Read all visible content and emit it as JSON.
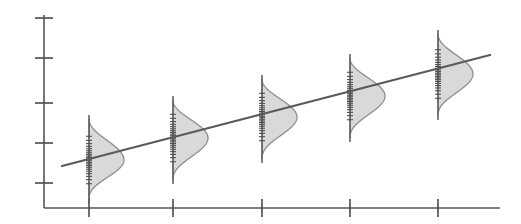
{
  "chart_data": {
    "type": "line",
    "title": "",
    "subtitle": "",
    "xlabel": "",
    "ylabel": "",
    "grid": false,
    "legend": null,
    "annotations": [],
    "axis": {
      "x_axis_visible": true,
      "y_axis_visible": true,
      "x_tick_labels": [
        "",
        "",
        "",
        "",
        ""
      ],
      "y_tick_labels": [
        "",
        "",
        "",
        "",
        ""
      ],
      "x_tick_count": 5,
      "y_tick_count": 5,
      "xlim": [
        0,
        6
      ],
      "ylim": [
        0,
        5
      ],
      "x_tick_values": [
        1,
        2,
        3,
        4,
        5
      ],
      "y_tick_values": [
        1,
        2,
        3,
        4,
        5
      ]
    },
    "categories": [
      "1",
      "2",
      "3",
      "4",
      "5"
    ],
    "x": [
      1,
      2,
      3,
      4,
      5
    ],
    "values": [
      1.55,
      2.05,
      2.55,
      3.05,
      3.6
    ],
    "series": [
      {
        "name": "trend",
        "type": "line",
        "x": [
          0.78,
          5.62
        ],
        "values": [
          1.4,
          4.16
        ]
      },
      {
        "name": "distributions",
        "type": "half-violin",
        "values": [
          1.55,
          2.05,
          2.55,
          3.05,
          3.6
        ],
        "spread": [
          0.95,
          0.95,
          0.95,
          0.95,
          0.95
        ]
      }
    ],
    "colors": {
      "density_fill": "#d6d6d6",
      "density_stroke": "#8e8e8e",
      "trend_line": "#5a5a5a",
      "axis": "#555555",
      "rug": "#4e4e4e",
      "background": "#ffffff"
    },
    "geometry": {
      "plot_left": 44,
      "plot_bottom": 208,
      "plot_top": 15,
      "plot_right": 500,
      "y_tick_px": [
        18,
        58,
        103,
        143,
        183
      ],
      "x_tick_px": [
        89,
        173,
        262,
        350,
        438
      ],
      "tick_len_x": 9,
      "tick_len_y": 9,
      "trend_px": [
        [
          62,
          166
        ],
        [
          490,
          55
        ]
      ],
      "distributions": [
        {
          "cx": 89,
          "mean_y": 166,
          "top_y": 119,
          "bottom_y": 199,
          "peak_w": 35,
          "peak_y": 160
        },
        {
          "cx": 173,
          "mean_y": 144,
          "top_y": 100,
          "bottom_y": 180,
          "peak_w": 35,
          "peak_y": 138
        },
        {
          "cx": 262,
          "mean_y": 122,
          "top_y": 79,
          "bottom_y": 159,
          "peak_w": 35,
          "peak_y": 117
        },
        {
          "cx": 350,
          "mean_y": 100,
          "top_y": 58,
          "bottom_y": 138,
          "peak_w": 35,
          "peak_y": 96
        },
        {
          "cx": 438,
          "mean_y": 78,
          "top_y": 34,
          "bottom_y": 116,
          "peak_w": 35,
          "peak_y": 74
        }
      ],
      "rug_tick_half_len": 3,
      "rug_counts": [
        22,
        22,
        22,
        22,
        22
      ]
    }
  }
}
